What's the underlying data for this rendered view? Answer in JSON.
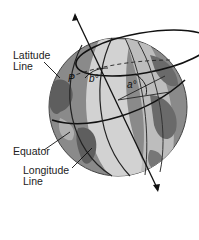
{
  "diagram": {
    "labels": {
      "latitude_line": [
        "Latitude",
        "Line"
      ],
      "equator": "Equator",
      "longitude_line": [
        "Longitude",
        "Line"
      ]
    },
    "symbols": {
      "point": "P",
      "longitude_angle": "b°",
      "latitude_angle": "a°"
    },
    "colors": {
      "ocean_dark": "#7a7a7a",
      "ocean_light": "#c4c4c4",
      "land": "#5a5a5a",
      "band_light": "#d6d6d6",
      "lines": "#111111"
    }
  }
}
